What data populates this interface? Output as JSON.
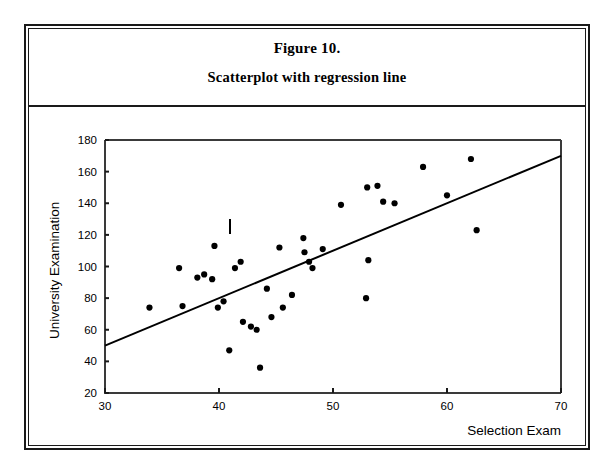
{
  "figure": {
    "title": "Figure 10.",
    "subtitle": "Scatterplot with regression line"
  },
  "chart_data": {
    "type": "scatter",
    "title": "Figure 10. Scatterplot with regression line",
    "xlabel": "Selection Exam",
    "ylabel": "University Examination",
    "xlim": [
      30,
      70
    ],
    "ylim": [
      20,
      180
    ],
    "xticks": [
      30,
      40,
      50,
      60,
      70
    ],
    "yticks": [
      20,
      40,
      60,
      80,
      100,
      120,
      140,
      160,
      180
    ],
    "grid": false,
    "legend": null,
    "points": [
      {
        "x": 33.9,
        "y": 74
      },
      {
        "x": 36.5,
        "y": 99
      },
      {
        "x": 36.8,
        "y": 75
      },
      {
        "x": 38.1,
        "y": 93
      },
      {
        "x": 38.7,
        "y": 95
      },
      {
        "x": 39.4,
        "y": 92
      },
      {
        "x": 39.6,
        "y": 113
      },
      {
        "x": 39.9,
        "y": 74
      },
      {
        "x": 40.4,
        "y": 78
      },
      {
        "x": 40.9,
        "y": 47
      },
      {
        "x": 41.4,
        "y": 99
      },
      {
        "x": 41.9,
        "y": 103
      },
      {
        "x": 42.1,
        "y": 65
      },
      {
        "x": 42.8,
        "y": 62
      },
      {
        "x": 43.3,
        "y": 60
      },
      {
        "x": 43.6,
        "y": 36
      },
      {
        "x": 44.2,
        "y": 86
      },
      {
        "x": 44.6,
        "y": 68
      },
      {
        "x": 45.3,
        "y": 112
      },
      {
        "x": 45.6,
        "y": 74
      },
      {
        "x": 46.4,
        "y": 82
      },
      {
        "x": 47.4,
        "y": 118
      },
      {
        "x": 47.5,
        "y": 109
      },
      {
        "x": 47.9,
        "y": 103
      },
      {
        "x": 48.2,
        "y": 99
      },
      {
        "x": 49.1,
        "y": 111
      },
      {
        "x": 50.7,
        "y": 139
      },
      {
        "x": 52.9,
        "y": 80
      },
      {
        "x": 53.0,
        "y": 150
      },
      {
        "x": 53.1,
        "y": 104
      },
      {
        "x": 53.9,
        "y": 151
      },
      {
        "x": 54.4,
        "y": 141
      },
      {
        "x": 55.4,
        "y": 140
      },
      {
        "x": 57.9,
        "y": 163
      },
      {
        "x": 60.0,
        "y": 145
      },
      {
        "x": 62.1,
        "y": 168
      },
      {
        "x": 62.6,
        "y": 123
      }
    ],
    "regression_line": {
      "x0": 30,
      "y0": 50,
      "x1": 70,
      "y1": 170
    }
  }
}
